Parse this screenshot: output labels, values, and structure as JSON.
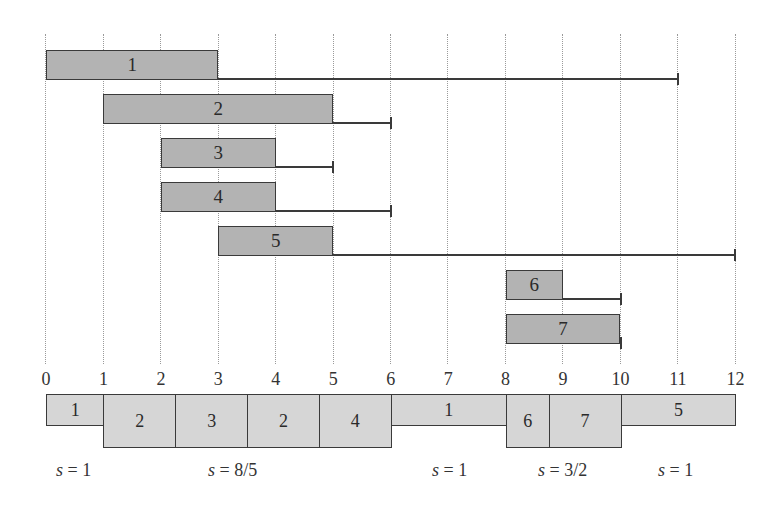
{
  "figure": {
    "type": "job scheduling diagram (release time / deadline windows and speed-scaled schedule)",
    "axis": {
      "ticks": [
        "0",
        "1",
        "2",
        "3",
        "4",
        "5",
        "6",
        "7",
        "8",
        "9",
        "10",
        "11",
        "12"
      ],
      "origin_px": 46,
      "unit_px": 57.45
    },
    "jobs": [
      {
        "label": "1",
        "release": 0,
        "work_end": 3,
        "deadline": 11,
        "row_top": 50
      },
      {
        "label": "2",
        "release": 1,
        "work_end": 5,
        "deadline": 6,
        "row_top": 94
      },
      {
        "label": "3",
        "release": 2,
        "work_end": 4,
        "deadline": 5,
        "row_top": 138
      },
      {
        "label": "4",
        "release": 2,
        "work_end": 4,
        "deadline": 6,
        "row_top": 182
      },
      {
        "label": "5",
        "release": 3,
        "work_end": 5,
        "deadline": 12,
        "row_top": 226
      },
      {
        "label": "6",
        "release": 8,
        "work_end": 9,
        "deadline": 10,
        "row_top": 270
      },
      {
        "label": "7",
        "release": 8,
        "work_end": 10,
        "deadline": 10,
        "row_top": 314
      }
    ],
    "schedule": [
      {
        "label": "1",
        "start": 0,
        "end": 1,
        "tall": false
      },
      {
        "label": "2",
        "start": 1,
        "end": 2.25,
        "tall": true
      },
      {
        "label": "3",
        "start": 2.25,
        "end": 3.5,
        "tall": true
      },
      {
        "label": "2",
        "start": 3.5,
        "end": 4.75,
        "tall": true
      },
      {
        "label": "4",
        "start": 4.75,
        "end": 6,
        "tall": true
      },
      {
        "label": "1",
        "start": 6,
        "end": 8,
        "tall": false
      },
      {
        "label": "6",
        "start": 8,
        "end": 8.75,
        "tall": true
      },
      {
        "label": "7",
        "start": 8.75,
        "end": 10,
        "tall": true
      },
      {
        "label": "5",
        "start": 10,
        "end": 12,
        "tall": false
      }
    ],
    "speeds": [
      {
        "var": "s",
        "text": " = 1",
        "left": 56
      },
      {
        "var": "s",
        "text": " = 8/5",
        "left": 208
      },
      {
        "var": "s",
        "text": " = 1",
        "left": 432
      },
      {
        "var": "s",
        "text": " = 3/2",
        "left": 538
      },
      {
        "var": "s",
        "text": " = 1",
        "left": 658
      }
    ],
    "colors": {
      "job_fill": "#b3b3b3",
      "schedule_fill": "#d6d6d6",
      "stroke": "#3a3a3a",
      "grid": "#9a9a9a"
    }
  }
}
